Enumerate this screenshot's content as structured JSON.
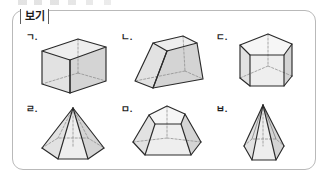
{
  "panel": {
    "label": "보기",
    "border_color": "#b9b9b9",
    "label_border_color": "#5f5f5f",
    "background": "#ffffff"
  },
  "figures": [
    {
      "label": "ㄱ.",
      "name": "cube",
      "shape_korean": "정육면체",
      "shape_english": "cube",
      "faces": 6,
      "base": "square",
      "type": "prism"
    },
    {
      "label": "ㄴ.",
      "name": "square-frustum",
      "shape_korean": "사각뿔대",
      "shape_english": "truncated square pyramid (frustum)",
      "faces": 6,
      "base": "square",
      "type": "frustum"
    },
    {
      "label": "ㄷ.",
      "name": "pentagonal-prism",
      "shape_korean": "오각기둥",
      "shape_english": "pentagonal prism",
      "faces": 7,
      "base": "pentagon",
      "type": "prism"
    },
    {
      "label": "ㄹ.",
      "name": "hexagonal-pyramid",
      "shape_korean": "육각뿔",
      "shape_english": "hexagonal pyramid",
      "faces": 7,
      "base": "hexagon",
      "type": "pyramid"
    },
    {
      "label": "ㅁ.",
      "name": "pentagonal-frustum",
      "shape_korean": "오각뿔대",
      "shape_english": "truncated pentagonal pyramid (frustum)",
      "faces": 7,
      "base": "pentagon",
      "type": "frustum"
    },
    {
      "label": "ㅂ.",
      "name": "tall-hexagonal-pyramid",
      "shape_korean": "육각뿔",
      "shape_english": "tall hexagonal pyramid",
      "faces": 7,
      "base": "hexagon",
      "type": "pyramid"
    }
  ],
  "style": {
    "visible_edge_color": "#2a2a2a",
    "hidden_edge_color": "#8c8c8c",
    "face_light": "#eeeeee",
    "face_mid": "#e2e2e2",
    "face_dark": "#d4d4d4"
  }
}
